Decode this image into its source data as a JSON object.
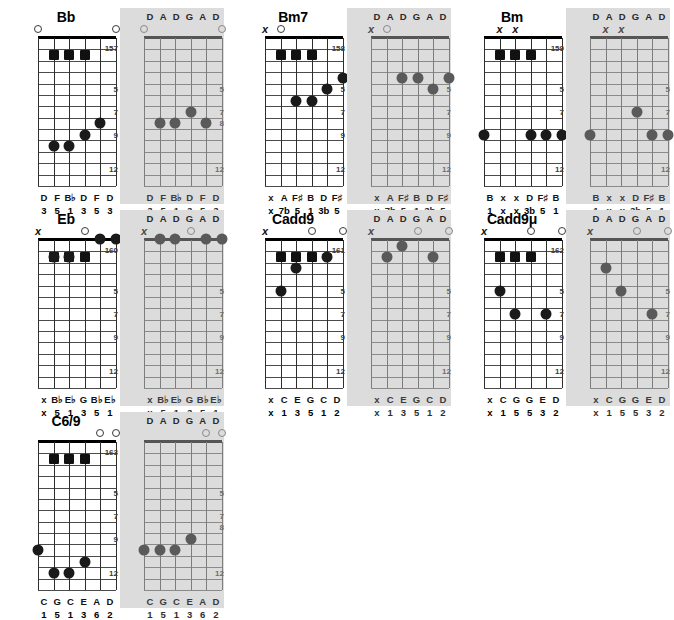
{
  "page": {
    "tuning_label": [
      "D",
      "A",
      "D",
      "G",
      "A",
      "D"
    ],
    "fret_marks_standard": [
      "5",
      "7",
      "9",
      "12"
    ],
    "fret_marks_alt": [
      "5",
      "7",
      "8",
      "12"
    ],
    "mute_symbol": "x",
    "accent_dot_color": "#1a1a1a",
    "alt_panel_color": "#dcdcdc"
  },
  "groups": [
    {
      "name": "Bb",
      "title": "Bb",
      "fig_standard": "157",
      "fig_alt": "",
      "standard": {
        "fretnums": [
          "5",
          "7",
          "9",
          "12"
        ],
        "open_strings": [
          0,
          5
        ],
        "muted_strings": [],
        "barre_squares": [
          1,
          2,
          3
        ],
        "dots": [
          {
            "string": 1,
            "fret": 10
          },
          {
            "string": 2,
            "fret": 10
          },
          {
            "string": 3,
            "fret": 9
          },
          {
            "string": 4,
            "fret": 8
          }
        ],
        "notes": [
          "D",
          "F",
          "B♭",
          "D",
          "F",
          "D"
        ],
        "degrees": [
          "3",
          "5",
          "1",
          "3",
          "5",
          "3"
        ]
      },
      "alt": {
        "fretnums": [
          "5",
          "7",
          "8",
          "12"
        ],
        "open_strings": [
          0,
          5
        ],
        "muted_strings": [],
        "barre_squares": [],
        "dots": [
          {
            "string": 1,
            "fret": 8
          },
          {
            "string": 2,
            "fret": 8
          },
          {
            "string": 3,
            "fret": 7
          },
          {
            "string": 4,
            "fret": 8
          }
        ],
        "notes": [
          "D",
          "F",
          "B♭",
          "D",
          "F",
          "D"
        ],
        "degrees": [
          "3",
          "5",
          "1",
          "3",
          "5",
          "3"
        ]
      }
    },
    {
      "name": "Bm7",
      "title": "Bm7",
      "fig_standard": "158",
      "fig_alt": "",
      "standard": {
        "fretnums": [
          "5",
          "7",
          "9",
          "12"
        ],
        "open_strings": [
          1
        ],
        "muted_strings": [
          0
        ],
        "barre_squares": [
          1,
          2,
          3
        ],
        "dots": [
          {
            "string": 2,
            "fret": 6
          },
          {
            "string": 3,
            "fret": 6
          },
          {
            "string": 4,
            "fret": 5
          },
          {
            "string": 5,
            "fret": 4
          }
        ],
        "notes": [
          "x",
          "A",
          "F♯",
          "B",
          "D",
          "F♯"
        ],
        "degrees": [
          "x",
          "7b",
          "5",
          "1",
          "3b",
          "5"
        ]
      },
      "alt": {
        "fretnums": [
          "5",
          "7",
          "9",
          "12"
        ],
        "open_strings": [
          1
        ],
        "muted_strings": [
          0
        ],
        "barre_squares": [],
        "dots": [
          {
            "string": 2,
            "fret": 4
          },
          {
            "string": 3,
            "fret": 4
          },
          {
            "string": 4,
            "fret": 5
          },
          {
            "string": 5,
            "fret": 4
          }
        ],
        "notes": [
          "x",
          "A",
          "F♯",
          "B",
          "D",
          "F♯"
        ],
        "degrees": [
          "x",
          "7b",
          "5",
          "1",
          "3b",
          "5"
        ]
      }
    },
    {
      "name": "Bm",
      "title": "Bm",
      "fig_standard": "159",
      "fig_alt": "",
      "standard": {
        "fretnums": [
          "5",
          "7",
          "9",
          "12"
        ],
        "open_strings": [],
        "muted_strings": [
          1,
          2
        ],
        "barre_squares": [
          1,
          2,
          3
        ],
        "dots": [
          {
            "string": 0,
            "fret": 9
          },
          {
            "string": 3,
            "fret": 9
          },
          {
            "string": 4,
            "fret": 9
          },
          {
            "string": 5,
            "fret": 9
          }
        ],
        "notes": [
          "B",
          "x",
          "x",
          "D",
          "F♯",
          "B"
        ],
        "degrees": [
          "1",
          "x",
          "x",
          "3b",
          "5",
          "1"
        ]
      },
      "alt": {
        "fretnums": [
          "5",
          "7",
          "9",
          "12"
        ],
        "open_strings": [],
        "muted_strings": [
          1,
          2
        ],
        "barre_squares": [],
        "dots": [
          {
            "string": 0,
            "fret": 9
          },
          {
            "string": 3,
            "fret": 7
          },
          {
            "string": 4,
            "fret": 9
          },
          {
            "string": 5,
            "fret": 9
          }
        ],
        "notes": [
          "B",
          "x",
          "x",
          "D",
          "F♯",
          "B"
        ],
        "degrees": [
          "1",
          "x",
          "x",
          "3b",
          "5",
          "1"
        ]
      }
    },
    {
      "name": "Eb",
      "title": "Eb",
      "fig_standard": "160",
      "fig_alt": "",
      "standard": {
        "fretnums": [
          "5",
          "7",
          "9",
          "12"
        ],
        "open_strings": [
          3
        ],
        "muted_strings": [
          0
        ],
        "barre_squares": [
          1,
          2,
          3
        ],
        "dots": [
          {
            "string": 1,
            "fret": 2
          },
          {
            "string": 2,
            "fret": 2
          },
          {
            "string": 4,
            "fret": 0
          },
          {
            "string": 5,
            "fret": 0
          }
        ],
        "notes": [
          "x",
          "B♭",
          "E♭",
          "G",
          "B♭",
          "E♭"
        ],
        "degrees": [
          "x",
          "5",
          "1",
          "3",
          "5",
          "1"
        ]
      },
      "alt": {
        "fretnums": [
          "5",
          "7",
          "9",
          "12"
        ],
        "open_strings": [
          3
        ],
        "muted_strings": [
          0
        ],
        "barre_squares": [],
        "dots": [
          {
            "string": 1,
            "fret": 0
          },
          {
            "string": 2,
            "fret": 0
          },
          {
            "string": 4,
            "fret": 0
          },
          {
            "string": 5,
            "fret": 0
          }
        ],
        "notes": [
          "x",
          "B♭",
          "E♭",
          "G",
          "B♭",
          "E♭"
        ],
        "degrees": [
          "x",
          "5",
          "1",
          "3",
          "5",
          "1"
        ]
      }
    },
    {
      "name": "Cadd9",
      "title": "Cadd9",
      "fig_standard": "161",
      "fig_alt": "",
      "standard": {
        "fretnums": [
          "5",
          "7",
          "9",
          "12"
        ],
        "open_strings": [
          3,
          5
        ],
        "muted_strings": [
          0
        ],
        "barre_squares": [
          1,
          2,
          3
        ],
        "dots": [
          {
            "string": 1,
            "fret": 5
          },
          {
            "string": 2,
            "fret": 3
          },
          {
            "string": 4,
            "fret": 2
          }
        ],
        "notes": [
          "x",
          "C",
          "E",
          "G",
          "C",
          "D"
        ],
        "degrees": [
          "x",
          "1",
          "3",
          "5",
          "1",
          "2"
        ]
      },
      "alt": {
        "fretnums": [
          "5",
          "7",
          "9",
          "12"
        ],
        "open_strings": [
          3,
          5
        ],
        "muted_strings": [
          0
        ],
        "barre_squares": [],
        "dots": [
          {
            "string": 1,
            "fret": 2
          },
          {
            "string": 2,
            "fret": 1
          },
          {
            "string": 4,
            "fret": 2
          }
        ],
        "notes": [
          "x",
          "C",
          "E",
          "G",
          "C",
          "D"
        ],
        "degrees": [
          "x",
          "1",
          "3",
          "5",
          "1",
          "2"
        ]
      }
    },
    {
      "name": "Cadd9mu",
      "title": "Cadd9μ",
      "fig_standard": "162",
      "fig_alt": "",
      "standard": {
        "fretnums": [
          "5",
          "7",
          "9",
          "12"
        ],
        "open_strings": [
          3,
          5
        ],
        "muted_strings": [
          0
        ],
        "barre_squares": [
          1,
          2,
          3
        ],
        "dots": [
          {
            "string": 1,
            "fret": 5
          },
          {
            "string": 2,
            "fret": 7
          },
          {
            "string": 4,
            "fret": 7
          }
        ],
        "notes": [
          "x",
          "C",
          "G",
          "G",
          "E",
          "D"
        ],
        "degrees": [
          "x",
          "1",
          "5",
          "5",
          "3",
          "2"
        ]
      },
      "alt": {
        "fretnums": [
          "5",
          "7",
          "9",
          "12"
        ],
        "open_strings": [
          3,
          5
        ],
        "muted_strings": [
          0
        ],
        "barre_squares": [],
        "dots": [
          {
            "string": 1,
            "fret": 3
          },
          {
            "string": 2,
            "fret": 5
          },
          {
            "string": 4,
            "fret": 7
          }
        ],
        "notes": [
          "x",
          "C",
          "G",
          "G",
          "E",
          "D"
        ],
        "degrees": [
          "x",
          "1",
          "5",
          "5",
          "3",
          "2"
        ]
      }
    },
    {
      "name": "C6/9",
      "title": "C6/9",
      "fig_standard": "163",
      "fig_alt": "",
      "standard": {
        "fretnums": [
          "5",
          "7",
          "9",
          "12"
        ],
        "open_strings": [
          4,
          5
        ],
        "muted_strings": [],
        "barre_squares": [
          1,
          2,
          3
        ],
        "dots": [
          {
            "string": 0,
            "fret": 10
          },
          {
            "string": 1,
            "fret": 12
          },
          {
            "string": 2,
            "fret": 12
          },
          {
            "string": 3,
            "fret": 11
          }
        ],
        "notes": [
          "C",
          "G",
          "C",
          "E",
          "A",
          "D"
        ],
        "degrees": [
          "1",
          "5",
          "1",
          "3",
          "6",
          "2"
        ]
      },
      "alt": {
        "fretnums": [
          "5",
          "7",
          "9",
          "12"
        ],
        "open_strings": [
          4,
          5
        ],
        "muted_strings": [],
        "barre_squares": [],
        "dots": [
          {
            "string": 0,
            "fret": 10
          },
          {
            "string": 1,
            "fret": 10
          },
          {
            "string": 2,
            "fret": 10
          },
          {
            "string": 3,
            "fret": 9
          }
        ],
        "notes": [
          "C",
          "G",
          "C",
          "E",
          "A",
          "D"
        ],
        "degrees": [
          "1",
          "5",
          "1",
          "3",
          "6",
          "2"
        ]
      }
    }
  ],
  "layout": {
    "group_positions": [
      {
        "x": 14,
        "y": 8
      },
      {
        "x": 241,
        "y": 8
      },
      {
        "x": 460,
        "y": 8
      },
      {
        "x": 14,
        "y": 210
      },
      {
        "x": 241,
        "y": 210
      },
      {
        "x": 460,
        "y": 210
      },
      {
        "x": 14,
        "y": 412
      }
    ]
  }
}
